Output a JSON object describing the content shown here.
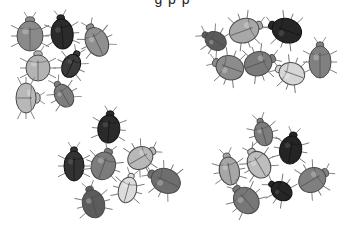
{
  "image": {
    "description": "Four groups of hand-drawn beetles (seven per group) in varying shades of gray on a white background",
    "background": "#ffffff",
    "caption_fragment": "g     p          p"
  },
  "clusters": [
    {
      "name": "top-left",
      "beetles": [
        {
          "x": 30,
          "y": 34,
          "w": 26,
          "h": 30,
          "rot": 0,
          "fill": "#8a8a8a"
        },
        {
          "x": 62,
          "y": 32,
          "w": 22,
          "h": 30,
          "rot": -5,
          "fill": "#2b2b2b"
        },
        {
          "x": 96,
          "y": 40,
          "w": 22,
          "h": 30,
          "rot": -25,
          "fill": "#8f8f8f"
        },
        {
          "x": 38,
          "y": 66,
          "w": 24,
          "h": 26,
          "rot": 0,
          "fill": "#b3b3b3"
        },
        {
          "x": 72,
          "y": 64,
          "w": 18,
          "h": 24,
          "rot": 25,
          "fill": "#3a3a3a"
        },
        {
          "x": 28,
          "y": 98,
          "w": 30,
          "h": 20,
          "rot": 90,
          "fill": "#b8b8b8"
        },
        {
          "x": 63,
          "y": 94,
          "w": 18,
          "h": 24,
          "rot": -30,
          "fill": "#7d7d7d"
        }
      ]
    },
    {
      "name": "top-right",
      "beetles": [
        {
          "x": 214,
          "y": 40,
          "w": 18,
          "h": 22,
          "rot": -60,
          "fill": "#5a5a5a"
        },
        {
          "x": 246,
          "y": 30,
          "w": 24,
          "h": 30,
          "rot": 70,
          "fill": "#a8a8a8"
        },
        {
          "x": 285,
          "y": 30,
          "w": 24,
          "h": 30,
          "rot": -70,
          "fill": "#262626"
        },
        {
          "x": 228,
          "y": 67,
          "w": 24,
          "h": 28,
          "rot": -70,
          "fill": "#8c8c8c"
        },
        {
          "x": 260,
          "y": 63,
          "w": 24,
          "h": 28,
          "rot": 70,
          "fill": "#7a7a7a"
        },
        {
          "x": 290,
          "y": 73,
          "w": 22,
          "h": 26,
          "rot": -70,
          "fill": "#d6d6d6"
        },
        {
          "x": 320,
          "y": 60,
          "w": 22,
          "h": 32,
          "rot": 0,
          "fill": "#808080"
        }
      ]
    },
    {
      "name": "bottom-left",
      "beetles": [
        {
          "x": 109,
          "y": 127,
          "w": 22,
          "h": 28,
          "rot": 5,
          "fill": "#2a2a2a"
        },
        {
          "x": 74,
          "y": 164,
          "w": 20,
          "h": 30,
          "rot": 0,
          "fill": "#333333"
        },
        {
          "x": 104,
          "y": 164,
          "w": 24,
          "h": 28,
          "rot": 20,
          "fill": "#7c7c7c"
        },
        {
          "x": 142,
          "y": 157,
          "w": 22,
          "h": 26,
          "rot": 60,
          "fill": "#b8b8b8"
        },
        {
          "x": 128,
          "y": 188,
          "w": 18,
          "h": 26,
          "rot": 15,
          "fill": "#dcdcdc"
        },
        {
          "x": 164,
          "y": 180,
          "w": 24,
          "h": 30,
          "rot": -65,
          "fill": "#6e6e6e"
        },
        {
          "x": 93,
          "y": 202,
          "w": 22,
          "h": 28,
          "rot": -15,
          "fill": "#5c5c5c"
        }
      ]
    },
    {
      "name": "bottom-right",
      "beetles": [
        {
          "x": 263,
          "y": 132,
          "w": 18,
          "h": 24,
          "rot": -15,
          "fill": "#7c7c7c"
        },
        {
          "x": 291,
          "y": 148,
          "w": 22,
          "h": 28,
          "rot": 10,
          "fill": "#242424"
        },
        {
          "x": 229,
          "y": 169,
          "w": 20,
          "h": 28,
          "rot": -10,
          "fill": "#a6a6a6"
        },
        {
          "x": 258,
          "y": 163,
          "w": 22,
          "h": 28,
          "rot": -30,
          "fill": "#bdbdbd"
        },
        {
          "x": 280,
          "y": 190,
          "w": 18,
          "h": 22,
          "rot": -55,
          "fill": "#262626"
        },
        {
          "x": 314,
          "y": 179,
          "w": 24,
          "h": 28,
          "rot": 60,
          "fill": "#808080"
        },
        {
          "x": 245,
          "y": 199,
          "w": 24,
          "h": 28,
          "rot": -40,
          "fill": "#777777"
        }
      ]
    }
  ]
}
